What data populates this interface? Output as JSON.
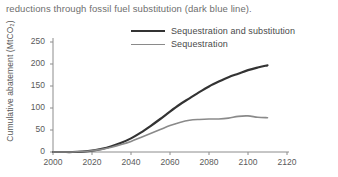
{
  "caption": "reductions through fossil fuel substitution (dark blue line).",
  "chart_data": {
    "type": "line",
    "title": "",
    "xlabel": "",
    "ylabel": "Cumulative abatement (MtCO₂)",
    "xlim": [
      2000,
      2120
    ],
    "ylim": [
      0,
      250
    ],
    "xticks": [
      2000,
      2020,
      2040,
      2060,
      2080,
      2100,
      2120
    ],
    "yticks": [
      0,
      50,
      100,
      150,
      200,
      250
    ],
    "grid": false,
    "legend_position": "top-right",
    "x": [
      2000,
      2005,
      2010,
      2015,
      2020,
      2025,
      2030,
      2035,
      2040,
      2045,
      2050,
      2055,
      2060,
      2065,
      2070,
      2075,
      2080,
      2085,
      2090,
      2095,
      2100,
      2105,
      2110
    ],
    "series": [
      {
        "name": "Sequestration and substitution",
        "color": "#333333",
        "width": 2.2,
        "values": [
          0,
          0,
          0,
          1,
          3,
          7,
          13,
          21,
          31,
          44,
          59,
          75,
          92,
          108,
          122,
          136,
          149,
          160,
          170,
          178,
          186,
          192,
          197
        ]
      },
      {
        "name": "Sequestration",
        "color": "#8a8a8a",
        "width": 1.6,
        "values": [
          0,
          0,
          0,
          1,
          3,
          6,
          11,
          17,
          24,
          33,
          42,
          51,
          60,
          67,
          72,
          74,
          75,
          75,
          77,
          81,
          82,
          79,
          78
        ]
      }
    ]
  },
  "axis": {
    "line_color": "#8c8c8c",
    "tick_color": "#8c8c8c"
  }
}
